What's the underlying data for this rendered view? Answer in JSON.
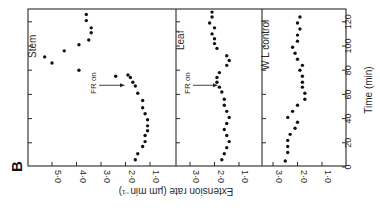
{
  "figure_label": "B",
  "chart_data": {
    "type": "scatter",
    "orientation": "rotated-90",
    "xlabel": "Time (min)",
    "ylabel": "Extension rate (µm min⁻¹)",
    "x_ticks": [
      0,
      20,
      40,
      60,
      80,
      100,
      120
    ],
    "xlim": [
      0,
      128
    ],
    "annotation": "FR on",
    "annotation_time": 75,
    "panels": [
      {
        "name": "Stem",
        "y_ticks": [
          5.0,
          4.0,
          3.0,
          2.0,
          1.0
        ],
        "y_tick_labels": [
          "5·0",
          "4·0",
          "3·0",
          "2·0",
          "1·0"
        ],
        "ylim": [
          5.8,
          0.0
        ],
        "annotation": "FR on",
        "points": [
          [
            6,
            1.6
          ],
          [
            11,
            1.5
          ],
          [
            17,
            1.3
          ],
          [
            21,
            1.2
          ],
          [
            26,
            1.2
          ],
          [
            30,
            1.1
          ],
          [
            34,
            1.1
          ],
          [
            39,
            1.1
          ],
          [
            44,
            1.2
          ],
          [
            49,
            1.3
          ],
          [
            55,
            1.3
          ],
          [
            61,
            1.5
          ],
          [
            67,
            1.6
          ],
          [
            70,
            1.7
          ],
          [
            74,
            1.8
          ],
          [
            76,
            1.9
          ],
          [
            75,
            2.4
          ],
          [
            80,
            3.9
          ],
          [
            86,
            5.0
          ],
          [
            91,
            5.3
          ],
          [
            96,
            4.5
          ],
          [
            101,
            3.9
          ],
          [
            105,
            3.5
          ],
          [
            111,
            3.4
          ],
          [
            115,
            3.4
          ],
          [
            121,
            3.6
          ],
          [
            126,
            3.6
          ]
        ]
      },
      {
        "name": "Leaf",
        "y_ticks": [
          3.0,
          2.0,
          1.0
        ],
        "y_tick_labels": [
          "3·0",
          "2·0",
          "1·0"
        ],
        "ylim": [
          3.55,
          0.0
        ],
        "annotation": "FR on",
        "points": [
          [
            6,
            1.7
          ],
          [
            11,
            1.6
          ],
          [
            16,
            1.5
          ],
          [
            21,
            1.4
          ],
          [
            26,
            1.5
          ],
          [
            31,
            1.6
          ],
          [
            36,
            1.5
          ],
          [
            41,
            1.4
          ],
          [
            46,
            1.5
          ],
          [
            51,
            1.6
          ],
          [
            56,
            1.6
          ],
          [
            62,
            1.7
          ],
          [
            66,
            1.8
          ],
          [
            70,
            1.9
          ],
          [
            74,
            1.9
          ],
          [
            78,
            1.8
          ],
          [
            84,
            1.5
          ],
          [
            88,
            1.4
          ],
          [
            92,
            1.5
          ],
          [
            98,
            1.9
          ],
          [
            102,
            2.0
          ],
          [
            106,
            2.0
          ],
          [
            110,
            2.1
          ],
          [
            115,
            2.0
          ],
          [
            119,
            2.2
          ],
          [
            124,
            2.1
          ],
          [
            128,
            2.1
          ]
        ]
      },
      {
        "name": "W L control",
        "y_ticks": [
          3.0,
          2.0,
          1.0
        ],
        "y_tick_labels": [
          "3·0",
          "2·0",
          "1·0"
        ],
        "ylim": [
          3.45,
          0.0
        ],
        "points": [
          [
            5,
            2.5
          ],
          [
            12,
            2.4
          ],
          [
            17,
            2.4
          ],
          [
            22,
            2.4
          ],
          [
            27,
            2.3
          ],
          [
            32,
            2.1
          ],
          [
            37,
            2.0
          ],
          [
            41,
            2.4
          ],
          [
            46,
            2.2
          ],
          [
            51,
            2.0
          ],
          [
            56,
            1.7
          ],
          [
            61,
            1.7
          ],
          [
            66,
            1.8
          ],
          [
            70,
            1.8
          ],
          [
            75,
            1.8
          ],
          [
            80,
            1.9
          ],
          [
            84,
            1.8
          ],
          [
            89,
            2.0
          ],
          [
            94,
            2.1
          ],
          [
            99,
            2.2
          ],
          [
            104,
            2.0
          ],
          [
            109,
            2.0
          ],
          [
            114,
            1.9
          ],
          [
            119,
            2.0
          ],
          [
            124,
            1.9
          ]
        ]
      }
    ]
  }
}
